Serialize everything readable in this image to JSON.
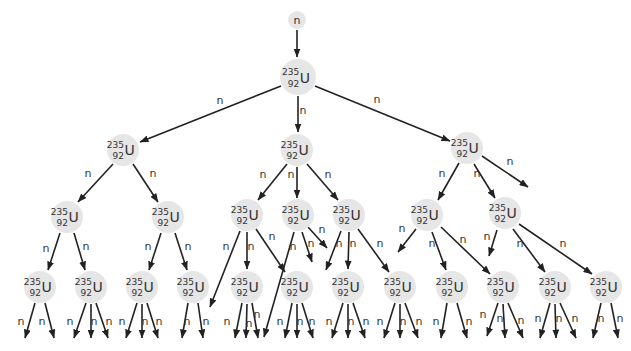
{
  "diagram": {
    "colors": {
      "node_fill": "#e6e6e6",
      "line": "#222222",
      "text": "#333333",
      "background": "#ffffff"
    },
    "nuclide": {
      "mass": "235",
      "atomic": "92",
      "symbol": "U"
    },
    "incoming_neutron": {
      "x": 297,
      "y": 20,
      "r": 9,
      "label": "n"
    },
    "nodes": [
      {
        "id": "L1",
        "x": 298,
        "y": 77,
        "r": 18
      },
      {
        "id": "L2a",
        "x": 123,
        "y": 150,
        "r": 16
      },
      {
        "id": "L2b",
        "x": 297,
        "y": 150,
        "r": 16
      },
      {
        "id": "L2c",
        "x": 467,
        "y": 148,
        "r": 16
      },
      {
        "id": "L3a",
        "x": 67,
        "y": 217,
        "r": 16
      },
      {
        "id": "L3b",
        "x": 168,
        "y": 217,
        "r": 16
      },
      {
        "id": "L3c",
        "x": 247,
        "y": 215,
        "r": 16
      },
      {
        "id": "L3d",
        "x": 298,
        "y": 215,
        "r": 16
      },
      {
        "id": "L3e",
        "x": 349,
        "y": 215,
        "r": 16
      },
      {
        "id": "L3f",
        "x": 427,
        "y": 215,
        "r": 16
      },
      {
        "id": "L3g",
        "x": 505,
        "y": 213,
        "r": 16
      },
      {
        "id": "L4a",
        "x": 40,
        "y": 287,
        "r": 16
      },
      {
        "id": "L4b",
        "x": 91,
        "y": 287,
        "r": 16
      },
      {
        "id": "L4c",
        "x": 142,
        "y": 287,
        "r": 16
      },
      {
        "id": "L4d",
        "x": 193,
        "y": 287,
        "r": 16
      },
      {
        "id": "L4e",
        "x": 247,
        "y": 287,
        "r": 16
      },
      {
        "id": "L4f",
        "x": 297,
        "y": 287,
        "r": 16
      },
      {
        "id": "L4g",
        "x": 348,
        "y": 287,
        "r": 16
      },
      {
        "id": "L4h",
        "x": 400,
        "y": 287,
        "r": 16
      },
      {
        "id": "L4i",
        "x": 452,
        "y": 287,
        "r": 16
      },
      {
        "id": "L4j",
        "x": 503,
        "y": 287,
        "r": 16
      },
      {
        "id": "L4k",
        "x": 555,
        "y": 287,
        "r": 16
      },
      {
        "id": "L4l",
        "x": 606,
        "y": 287,
        "r": 16
      }
    ],
    "arrows": [
      {
        "x1": 297,
        "y1": 30,
        "x2": 297,
        "y2": 57,
        "label": ""
      },
      {
        "x1": 281,
        "y1": 86,
        "x2": 140,
        "y2": 142,
        "label": "n",
        "lx": 220,
        "ly": 104
      },
      {
        "x1": 298,
        "y1": 96,
        "x2": 298,
        "y2": 132,
        "label": "n",
        "lx": 303,
        "ly": 114
      },
      {
        "x1": 315,
        "y1": 86,
        "x2": 450,
        "y2": 141,
        "label": "n",
        "lx": 377,
        "ly": 103
      },
      {
        "x1": 113,
        "y1": 164,
        "x2": 78,
        "y2": 202,
        "label": "n",
        "lx": 88,
        "ly": 177
      },
      {
        "x1": 133,
        "y1": 164,
        "x2": 158,
        "y2": 202,
        "label": "n",
        "lx": 153,
        "ly": 177
      },
      {
        "x1": 287,
        "y1": 164,
        "x2": 258,
        "y2": 200,
        "label": "n",
        "lx": 263,
        "ly": 178
      },
      {
        "x1": 297,
        "y1": 167,
        "x2": 297,
        "y2": 198,
        "label": "n",
        "lx": 291,
        "ly": 178
      },
      {
        "x1": 307,
        "y1": 164,
        "x2": 338,
        "y2": 200,
        "label": "n",
        "lx": 328,
        "ly": 178
      },
      {
        "x1": 459,
        "y1": 163,
        "x2": 438,
        "y2": 200,
        "label": "n",
        "lx": 442,
        "ly": 177
      },
      {
        "x1": 474,
        "y1": 164,
        "x2": 495,
        "y2": 198,
        "label": "n",
        "lx": 477,
        "ly": 177
      },
      {
        "x1": 482,
        "y1": 156,
        "x2": 528,
        "y2": 187,
        "label": "n",
        "lx": 510,
        "ly": 165
      },
      {
        "x1": 60,
        "y1": 233,
        "x2": 48,
        "y2": 270,
        "label": "n",
        "lx": 46,
        "ly": 252
      },
      {
        "x1": 74,
        "y1": 233,
        "x2": 85,
        "y2": 270,
        "label": "n",
        "lx": 86,
        "ly": 250
      },
      {
        "x1": 161,
        "y1": 233,
        "x2": 149,
        "y2": 270,
        "label": "n",
        "lx": 148,
        "ly": 250
      },
      {
        "x1": 175,
        "y1": 233,
        "x2": 187,
        "y2": 270,
        "label": "n",
        "lx": 188,
        "ly": 250
      },
      {
        "x1": 240,
        "y1": 231,
        "x2": 210,
        "y2": 307,
        "label": "n",
        "lx": 226,
        "ly": 250
      },
      {
        "x1": 247,
        "y1": 232,
        "x2": 247,
        "y2": 269,
        "label": "n",
        "lx": 251,
        "ly": 250
      },
      {
        "x1": 256,
        "y1": 229,
        "x2": 285,
        "y2": 272,
        "label": "n",
        "lx": 272,
        "ly": 240
      },
      {
        "x1": 294,
        "y1": 232,
        "x2": 264,
        "y2": 337,
        "label": "n",
        "lx": 293,
        "ly": 250
      },
      {
        "x1": 302,
        "y1": 232,
        "x2": 312,
        "y2": 262,
        "label": "n",
        "lx": 311,
        "ly": 247
      },
      {
        "x1": 308,
        "y1": 227,
        "x2": 327,
        "y2": 248,
        "label": "n",
        "lx": 322,
        "ly": 233
      },
      {
        "x1": 341,
        "y1": 231,
        "x2": 326,
        "y2": 270,
        "label": "n",
        "lx": 339,
        "ly": 247
      },
      {
        "x1": 349,
        "y1": 232,
        "x2": 348,
        "y2": 269,
        "label": "n",
        "lx": 353,
        "ly": 247
      },
      {
        "x1": 358,
        "y1": 229,
        "x2": 389,
        "y2": 272,
        "label": "n",
        "lx": 380,
        "ly": 247
      },
      {
        "x1": 416,
        "y1": 229,
        "x2": 398,
        "y2": 252,
        "label": "n",
        "lx": 402,
        "ly": 232
      },
      {
        "x1": 432,
        "y1": 232,
        "x2": 446,
        "y2": 270,
        "label": "n",
        "lx": 432,
        "ly": 247
      },
      {
        "x1": 441,
        "y1": 227,
        "x2": 490,
        "y2": 274,
        "label": "n",
        "lx": 463,
        "ly": 243
      },
      {
        "x1": 497,
        "y1": 230,
        "x2": 489,
        "y2": 256,
        "label": "n",
        "lx": 487,
        "ly": 240
      },
      {
        "x1": 513,
        "y1": 229,
        "x2": 545,
        "y2": 272,
        "label": "n",
        "lx": 520,
        "ly": 247
      },
      {
        "x1": 519,
        "y1": 224,
        "x2": 592,
        "y2": 274,
        "label": "n",
        "lx": 563,
        "ly": 247
      },
      {
        "x1": 35,
        "y1": 303,
        "x2": 25,
        "y2": 338,
        "label": "n",
        "lx": 21,
        "ly": 325
      },
      {
        "x1": 45,
        "y1": 303,
        "x2": 54,
        "y2": 338,
        "label": "n",
        "lx": 42,
        "ly": 325
      },
      {
        "x1": 86,
        "y1": 303,
        "x2": 74,
        "y2": 338,
        "label": "n",
        "lx": 70,
        "ly": 325
      },
      {
        "x1": 91,
        "y1": 304,
        "x2": 91,
        "y2": 338,
        "label": "n",
        "lx": 94,
        "ly": 325
      },
      {
        "x1": 96,
        "y1": 303,
        "x2": 108,
        "y2": 338,
        "label": "n",
        "lx": 109,
        "ly": 325
      },
      {
        "x1": 137,
        "y1": 303,
        "x2": 126,
        "y2": 338,
        "label": "n",
        "lx": 122,
        "ly": 325
      },
      {
        "x1": 142,
        "y1": 304,
        "x2": 142,
        "y2": 338,
        "label": "n",
        "lx": 145,
        "ly": 325
      },
      {
        "x1": 147,
        "y1": 303,
        "x2": 158,
        "y2": 338,
        "label": "n",
        "lx": 159,
        "ly": 325
      },
      {
        "x1": 188,
        "y1": 303,
        "x2": 182,
        "y2": 338,
        "label": "n",
        "lx": 187,
        "ly": 325
      },
      {
        "x1": 198,
        "y1": 303,
        "x2": 203,
        "y2": 338,
        "label": "n",
        "lx": 206,
        "ly": 325
      },
      {
        "x1": 242,
        "y1": 303,
        "x2": 235,
        "y2": 338,
        "label": "n",
        "lx": 227,
        "ly": 325
      },
      {
        "x1": 247,
        "y1": 304,
        "x2": 246,
        "y2": 338,
        "label": "n",
        "lx": 249,
        "ly": 327
      },
      {
        "x1": 252,
        "y1": 303,
        "x2": 258,
        "y2": 338,
        "label": "n",
        "lx": 257,
        "ly": 318
      },
      {
        "x1": 292,
        "y1": 303,
        "x2": 285,
        "y2": 338,
        "label": "n",
        "lx": 280,
        "ly": 325
      },
      {
        "x1": 297,
        "y1": 304,
        "x2": 297,
        "y2": 338,
        "label": "n",
        "lx": 300,
        "ly": 325
      },
      {
        "x1": 302,
        "y1": 303,
        "x2": 313,
        "y2": 338,
        "label": "n",
        "lx": 312,
        "ly": 325
      },
      {
        "x1": 343,
        "y1": 303,
        "x2": 332,
        "y2": 338,
        "label": "n",
        "lx": 329,
        "ly": 325
      },
      {
        "x1": 348,
        "y1": 304,
        "x2": 348,
        "y2": 338,
        "label": "n",
        "lx": 351,
        "ly": 325
      },
      {
        "x1": 353,
        "y1": 303,
        "x2": 365,
        "y2": 338,
        "label": "n",
        "lx": 366,
        "ly": 325
      },
      {
        "x1": 395,
        "y1": 303,
        "x2": 384,
        "y2": 338,
        "label": "n",
        "lx": 380,
        "ly": 325
      },
      {
        "x1": 400,
        "y1": 304,
        "x2": 400,
        "y2": 338,
        "label": "n",
        "lx": 403,
        "ly": 325
      },
      {
        "x1": 405,
        "y1": 303,
        "x2": 418,
        "y2": 338,
        "label": "n",
        "lx": 419,
        "ly": 325
      },
      {
        "x1": 447,
        "y1": 303,
        "x2": 441,
        "y2": 338,
        "label": "n",
        "lx": 436,
        "ly": 325
      },
      {
        "x1": 457,
        "y1": 303,
        "x2": 467,
        "y2": 338,
        "label": "n",
        "lx": 469,
        "ly": 325
      },
      {
        "x1": 498,
        "y1": 303,
        "x2": 487,
        "y2": 336,
        "label": "n",
        "lx": 483,
        "ly": 318
      },
      {
        "x1": 503,
        "y1": 304,
        "x2": 505,
        "y2": 338,
        "label": "n",
        "lx": 500,
        "ly": 322
      },
      {
        "x1": 508,
        "y1": 303,
        "x2": 523,
        "y2": 338,
        "label": "n",
        "lx": 521,
        "ly": 324
      },
      {
        "x1": 550,
        "y1": 303,
        "x2": 540,
        "y2": 338,
        "label": "n",
        "lx": 538,
        "ly": 322
      },
      {
        "x1": 555,
        "y1": 304,
        "x2": 556,
        "y2": 338,
        "label": "n",
        "lx": 559,
        "ly": 322
      },
      {
        "x1": 560,
        "y1": 303,
        "x2": 576,
        "y2": 338,
        "label": "n",
        "lx": 575,
        "ly": 322
      },
      {
        "x1": 601,
        "y1": 303,
        "x2": 593,
        "y2": 338,
        "label": "n",
        "lx": 601,
        "ly": 322
      },
      {
        "x1": 611,
        "y1": 303,
        "x2": 618,
        "y2": 338,
        "label": "n",
        "lx": 620,
        "ly": 322
      }
    ]
  }
}
